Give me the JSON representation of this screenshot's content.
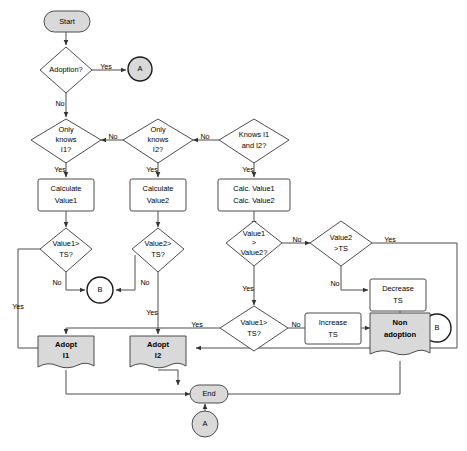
{
  "diagram": {
    "width": 467,
    "height": 451,
    "colors": {
      "background": "#ffffff",
      "shape_fill_white": "#ffffff",
      "shape_fill_gray": "#d9d9d9",
      "stroke": "#4d4d4d",
      "connector_stroke": "#1a1a1a",
      "text": "#000000"
    }
  },
  "nodes": {
    "start": {
      "label": "Start",
      "shape": "terminator",
      "fill": "#d9d9d9"
    },
    "adoption": {
      "label": "Adoption?",
      "shape": "decision",
      "fill": "#ffffff"
    },
    "connector_a_top": {
      "label": "A",
      "shape": "connector-circle",
      "fill": "#d9d9d9"
    },
    "only_knows_i1": {
      "label_lines": [
        "Only",
        "knows",
        "I1?"
      ],
      "shape": "decision",
      "fill": "#ffffff"
    },
    "only_knows_i2": {
      "label_lines": [
        "Only",
        "knows",
        "I2?"
      ],
      "shape": "decision",
      "fill": "#ffffff"
    },
    "knows_i1_and_i2": {
      "label_lines": [
        "Knows I1",
        "and I2?"
      ],
      "shape": "decision",
      "fill": "#ffffff"
    },
    "calculate_value1": {
      "label_lines": [
        "Calculate",
        "Value1"
      ],
      "shape": "process",
      "fill": "#ffffff"
    },
    "calculate_value2": {
      "label_lines": [
        "Calculate",
        "Value2"
      ],
      "shape": "process",
      "fill": "#ffffff"
    },
    "calc_both": {
      "label_lines": [
        "Calc. Value1",
        "Calc. Value2"
      ],
      "shape": "process",
      "fill": "#ffffff"
    },
    "value1_gt_ts": {
      "label_lines": [
        "Value1>",
        "TS?"
      ],
      "shape": "decision",
      "fill": "#ffffff"
    },
    "value2_gt_ts": {
      "label_lines": [
        "Value2>",
        "TS?"
      ],
      "shape": "decision",
      "fill": "#ffffff"
    },
    "value1_gt_value2": {
      "label_lines": [
        "Value1",
        ">",
        "Value2?"
      ],
      "shape": "decision",
      "fill": "#ffffff"
    },
    "value2_gt_ts_right": {
      "label_lines": [
        "Value2",
        ">TS"
      ],
      "shape": "decision",
      "fill": "#ffffff"
    },
    "value1_gt_ts_lower": {
      "label_lines": [
        "Value1>",
        "TS?"
      ],
      "shape": "decision",
      "fill": "#ffffff"
    },
    "connector_b_mid": {
      "label": "B",
      "shape": "connector-circle",
      "fill": "#ffffff"
    },
    "connector_b_right": {
      "label": "B",
      "shape": "connector-circle",
      "fill": "#ffffff"
    },
    "decrease_ts": {
      "label_lines": [
        "Decrease",
        "TS"
      ],
      "shape": "process",
      "fill": "#ffffff"
    },
    "increase_ts": {
      "label_lines": [
        "Increase",
        "TS"
      ],
      "shape": "process",
      "fill": "#ffffff"
    },
    "non_adoption": {
      "label_lines": [
        "Non",
        "adoption"
      ],
      "shape": "document",
      "fill": "#d9d9d9",
      "bold": true
    },
    "adopt_i1": {
      "label_lines": [
        "Adopt",
        "I1"
      ],
      "shape": "document",
      "fill": "#d9d9d9",
      "bold": true
    },
    "adopt_i2": {
      "label_lines": [
        "Adopt",
        "I2"
      ],
      "shape": "document",
      "fill": "#d9d9d9",
      "bold": true
    },
    "end": {
      "label": "End",
      "shape": "terminator",
      "fill": "#d9d9d9"
    },
    "connector_a_bottom": {
      "label": "A",
      "shape": "connector-circle",
      "fill": "#d9d9d9"
    }
  },
  "edge_labels": {
    "adoption_yes": "Yes",
    "adoption_no": "No",
    "i1_no": "No",
    "i1_yes": "Yes",
    "i2_no": "No",
    "i2_yes": "Yes",
    "both_yes": "Yes",
    "v1ts_no": "No",
    "v1ts_yes": "Yes",
    "v2ts_no": "No",
    "v2ts_yes": "Yes",
    "v1v2_no": "No",
    "v1v2_yes": "Yes",
    "v2tsr_yes": "Yes",
    "v2tsr_no": "No",
    "v1tsl_no": "No",
    "v1tsl_yes": "Yes"
  }
}
